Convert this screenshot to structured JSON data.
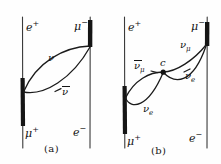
{
  "figure": {
    "type": "feynman-diagram-pair",
    "background_color": "#fefefe",
    "ink_color": "#141414",
    "panels": [
      {
        "id": "a",
        "caption": "(a)",
        "corner_labels": {
          "top_left": "e",
          "top_left_charge": "+",
          "top_right": "μ",
          "top_right_charge": "−",
          "bottom_left": "μ",
          "bottom_left_charge": "+",
          "bottom_right": "e",
          "bottom_right_charge": "−"
        },
        "internal_labels": [
          {
            "name": "upper-propagator-label",
            "symbol": "ν",
            "bar": false,
            "subscript": ""
          },
          {
            "name": "lower-propagator-label",
            "symbol": "ν",
            "bar": true,
            "subscript": ""
          }
        ]
      },
      {
        "id": "b",
        "caption": "(b)",
        "corner_labels": {
          "top_left": "e",
          "top_left_charge": "+",
          "top_right": "μ",
          "top_right_charge": "−",
          "bottom_left": "μ",
          "bottom_left_charge": "+",
          "bottom_right": "e",
          "bottom_right_charge": "−"
        },
        "vertex_label": "c",
        "internal_labels": [
          {
            "name": "anti-nu-mu-label",
            "symbol": "ν",
            "bar": true,
            "subscript": "μ"
          },
          {
            "name": "nu-mu-label",
            "symbol": "ν",
            "bar": false,
            "subscript": "μ"
          },
          {
            "name": "nu-e-upper-label",
            "symbol": "ν",
            "bar": false,
            "subscript": "e"
          },
          {
            "name": "nu-e-lower-label",
            "symbol": "ν",
            "bar": false,
            "subscript": "e"
          }
        ]
      }
    ]
  }
}
